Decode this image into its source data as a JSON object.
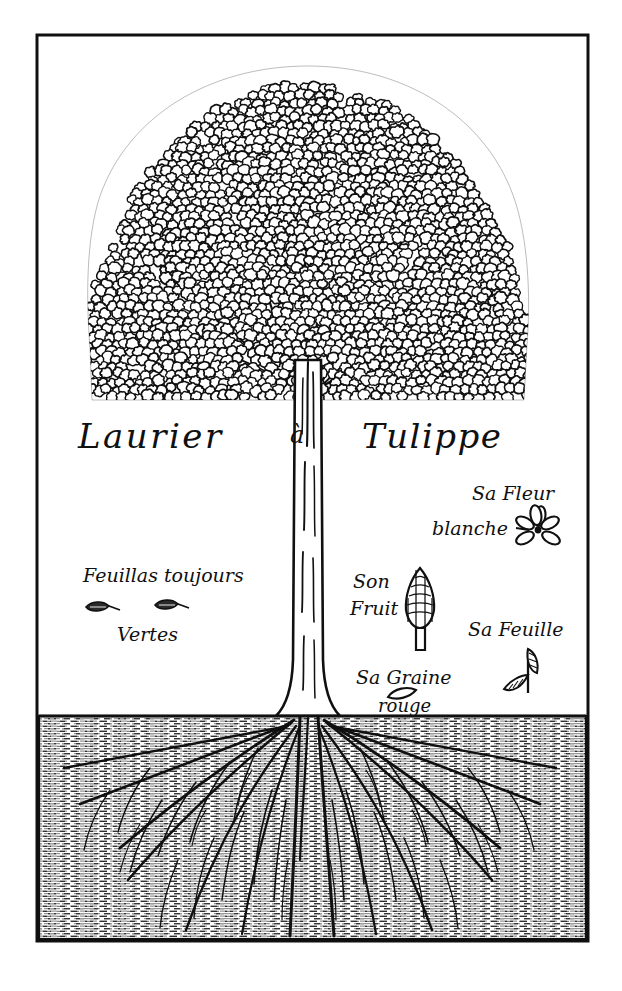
{
  "plate": {
    "kind": "botanical-engraving",
    "title": "Laurier à Tulippe",
    "title_parts": {
      "left": "Laurier",
      "middle": "à",
      "right": "Tulippe"
    },
    "background_color": "#ffffff",
    "ink_color": "#101010",
    "frame": {
      "visible": true,
      "x": 37,
      "y": 35,
      "width": 551,
      "height": 906,
      "stroke_color": "#101010",
      "stroke_width": 3
    },
    "ground_line_y": 715
  },
  "annotations": [
    {
      "id": "flower",
      "lines": [
        "Sa Fleur",
        "blanche"
      ],
      "meaning_icon": "flower-icon",
      "petal_count": 6,
      "x": 470,
      "y": 495
    },
    {
      "id": "foliage",
      "lines": [
        "Feuillas toujours",
        "Vertes"
      ],
      "meaning_icon": "leaf-pair-icon",
      "leaf_count": 2,
      "x": 85,
      "y": 575
    },
    {
      "id": "fruit",
      "lines": [
        "Son",
        "Fruit"
      ],
      "meaning_icon": "cone-fruit-icon",
      "x": 352,
      "y": 580
    },
    {
      "id": "leaf",
      "lines": [
        "Sa Feuille"
      ],
      "meaning_icon": "leaf-sprig-icon",
      "leaf_count": 2,
      "x": 468,
      "y": 630
    },
    {
      "id": "seed",
      "lines": [
        "Sa Graine",
        "rouge"
      ],
      "meaning_icon": "seed-icon",
      "x": 356,
      "y": 677
    }
  ],
  "tree": {
    "canopy": {
      "shape": "dome",
      "center_x": 308,
      "top_y": 68,
      "bottom_y": 400,
      "left_x": 88,
      "right_x": 528,
      "texture": "scalloped-leaf-clusters",
      "branch_rays": 14
    },
    "trunk": {
      "top_y": 360,
      "base_y": 716,
      "left_x": 294,
      "right_x": 322,
      "striation_count": 9
    },
    "roots": {
      "top_y": 716,
      "bottom_y": 938,
      "main_root_count": 12,
      "soil_texture": "horizontal-hatching"
    }
  }
}
